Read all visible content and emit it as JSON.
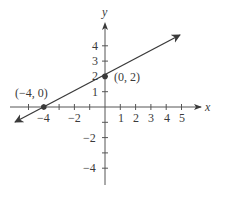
{
  "diagram": {
    "type": "coordinate-plane-line",
    "axes": {
      "x_label": "x",
      "y_label": "y",
      "x_tick_labels": [
        "−4",
        "−2",
        "1",
        "2",
        "3",
        "4",
        "5"
      ],
      "y_tick_labels": [
        "4",
        "3",
        "2",
        "1",
        "−2",
        "−4"
      ]
    },
    "points": [
      {
        "label": "(−4, 0)",
        "x": -4,
        "y": 0
      },
      {
        "label": "(0, 2)",
        "x": 0,
        "y": 2
      }
    ],
    "line": {
      "slope": 0.5,
      "intercept": 2,
      "arrows": "both"
    },
    "colors": {
      "ink": "#3a3a3a",
      "background": "#ffffff"
    }
  }
}
